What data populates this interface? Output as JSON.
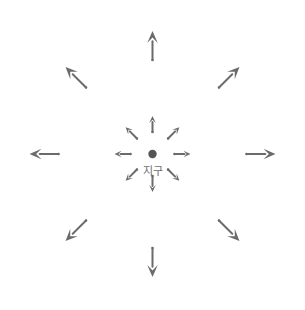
{
  "diagram": {
    "type": "radial-vector-field",
    "title": "",
    "canvas": {
      "width": 304,
      "height": 310
    },
    "background_color": "#ffffff",
    "arrow_color": "#6b6b6b",
    "center": {
      "label": "지구",
      "label_color": "#6e6e6e",
      "dot_color": "#555555",
      "dot_radius": 4.2,
      "x": 152.5,
      "y": 154,
      "label_offset_y": 11
    },
    "rings": [
      {
        "name": "inner-ring",
        "start_radius": 22,
        "arrow_length": 16,
        "head_length": 7,
        "head_width": 6.6,
        "stroke_width": 2.0
      },
      {
        "name": "outer-ring",
        "start_radius": 94,
        "arrow_length": 29,
        "head_length": 12,
        "head_width": 10.5,
        "stroke_width": 2.0
      }
    ],
    "directions": [
      {
        "name": "north",
        "label": "N",
        "angle_deg": 270
      },
      {
        "name": "northeast",
        "label": "NE",
        "angle_deg": 315
      },
      {
        "name": "east",
        "label": "E",
        "angle_deg": 0
      },
      {
        "name": "southeast",
        "label": "SE",
        "angle_deg": 45
      },
      {
        "name": "south",
        "label": "S",
        "angle_deg": 90
      },
      {
        "name": "southwest",
        "label": "SW",
        "angle_deg": 135
      },
      {
        "name": "west",
        "label": "W",
        "angle_deg": 180
      },
      {
        "name": "northwest",
        "label": "NW",
        "angle_deg": 225
      }
    ],
    "arrow_count": 16,
    "notes": ""
  }
}
